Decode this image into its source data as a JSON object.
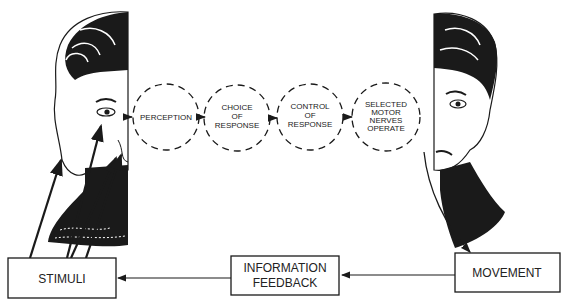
{
  "diagram": {
    "stages": [
      {
        "lines": [
          "PERCEPTION"
        ]
      },
      {
        "lines": [
          "CHOICE",
          "OF",
          "RESPONSE"
        ]
      },
      {
        "lines": [
          "CONTROL",
          "OF",
          "RESPONSE"
        ]
      },
      {
        "lines": [
          "SELECTED",
          "MOTOR",
          "NERVES",
          "OPERATE"
        ]
      }
    ],
    "boxes": {
      "stimuli": "STIMULI",
      "feedback_line1": "INFORMATION",
      "feedback_line2": "FEEDBACK",
      "movement": "MOVEMENT"
    },
    "illustrations": {
      "left": "woman-face-left-half",
      "right": "woman-face-right-half"
    },
    "colors": {
      "ink": "#1a1a1a",
      "background": "#ffffff"
    }
  }
}
